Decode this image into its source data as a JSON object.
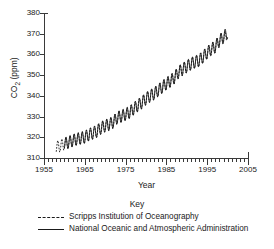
{
  "chart_data": {
    "type": "line",
    "title": "",
    "xlabel": "Year",
    "ylabel": "CO2 (ppm)",
    "ylabel_rich": "CO₂ (ppm)",
    "xlim": [
      1955,
      2005
    ],
    "ylim": [
      310,
      380
    ],
    "xticks": [
      1955,
      1965,
      1975,
      1985,
      1995,
      2005
    ],
    "xtick_labels": [
      "1955",
      "1965",
      "1975",
      "1985",
      "1995",
      "2005"
    ],
    "xminor_tick_interval": 1,
    "yticks": [
      310,
      320,
      330,
      340,
      350,
      360,
      370,
      380
    ],
    "ytick_labels": [
      "310",
      "320",
      "330",
      "340",
      "350",
      "360",
      "370",
      "380"
    ],
    "grid": false,
    "legend_position": "below",
    "annotation": "Seasonal sawtooth oscillation superimposed on rising trend; both records overlap closely.",
    "series": [
      {
        "name": "Scripps Institution of Oceanography",
        "style": "dashed",
        "color": "#1a1a1a",
        "x_start": 1958,
        "x_end": 1999.8,
        "seasonal_amplitude": 3.0,
        "x": [
          1958,
          1959,
          1960,
          1961,
          1962,
          1963,
          1964,
          1965,
          1966,
          1967,
          1968,
          1969,
          1970,
          1971,
          1972,
          1973,
          1974,
          1975,
          1976,
          1977,
          1978,
          1979,
          1980,
          1981,
          1982,
          1983,
          1984,
          1985,
          1986,
          1987,
          1988,
          1989,
          1990,
          1991,
          1992,
          1993,
          1994,
          1995,
          1996,
          1997,
          1998,
          1999
        ],
        "values": [
          315.2,
          315.9,
          316.8,
          317.5,
          318.3,
          319.0,
          319.5,
          320.0,
          321.2,
          322.0,
          322.9,
          324.5,
          325.5,
          326.2,
          327.3,
          329.5,
          330.1,
          331.0,
          332.0,
          333.7,
          335.3,
          336.7,
          338.6,
          339.9,
          341.0,
          342.6,
          344.2,
          345.8,
          347.1,
          348.8,
          351.4,
          352.8,
          354.1,
          355.4,
          356.3,
          357.0,
          358.8,
          360.8,
          362.5,
          363.7,
          366.6,
          368.3
        ]
      },
      {
        "name": "National Oceanic and Atmospheric Administration",
        "style": "solid",
        "color": "#1a1a1a",
        "x_start": 1960,
        "x_end": 2000.0,
        "seasonal_amplitude": 3.0,
        "x": [
          1960,
          1961,
          1962,
          1963,
          1964,
          1965,
          1966,
          1967,
          1968,
          1969,
          1970,
          1971,
          1972,
          1973,
          1974,
          1975,
          1976,
          1977,
          1978,
          1979,
          1980,
          1981,
          1982,
          1983,
          1984,
          1985,
          1986,
          1987,
          1988,
          1989,
          1990,
          1991,
          1992,
          1993,
          1994,
          1995,
          1996,
          1997,
          1998,
          1999,
          2000
        ],
        "values": [
          316.9,
          317.6,
          318.4,
          319.1,
          319.6,
          320.1,
          321.3,
          322.1,
          323.0,
          324.6,
          325.6,
          326.3,
          327.4,
          329.6,
          330.2,
          331.1,
          332.1,
          333.8,
          335.4,
          336.8,
          338.7,
          340.0,
          341.1,
          342.7,
          344.3,
          345.9,
          347.2,
          348.9,
          351.5,
          352.9,
          354.2,
          355.5,
          356.4,
          357.1,
          358.9,
          360.9,
          362.6,
          363.8,
          366.7,
          368.4,
          370.5
        ]
      }
    ]
  },
  "legend": {
    "title": "Key",
    "entries": [
      {
        "label": "Scripps Institution of Oceanography",
        "style": "dashed"
      },
      {
        "label": "National Oceanic and Atmospheric Administration",
        "style": "solid"
      }
    ]
  }
}
